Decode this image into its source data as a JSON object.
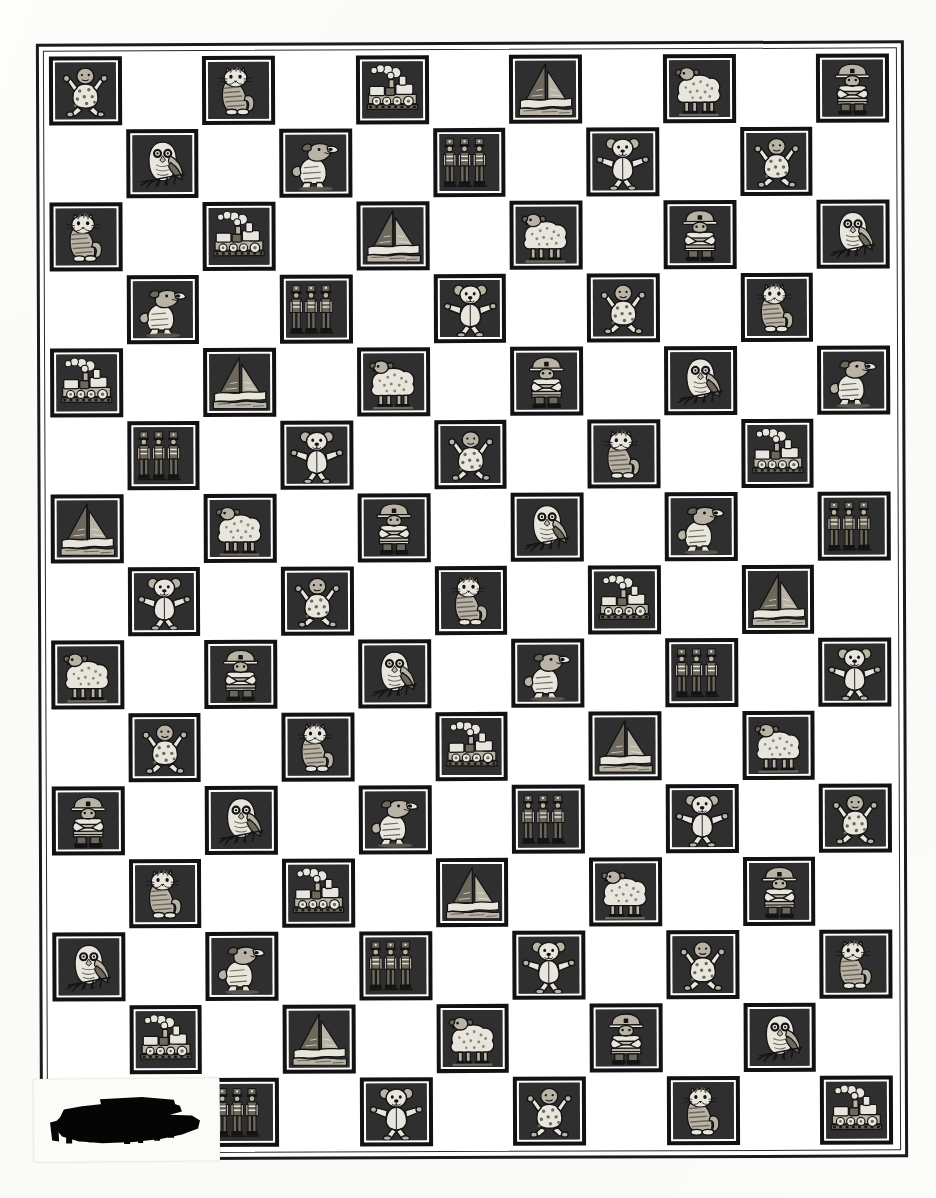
{
  "document": {
    "kind": "scanned-page",
    "description": "Checkerboard quilt / fabric design page of repeating nursery toy motifs in black bordered square blocks",
    "page_background": "#fdfdfb",
    "frame_color": "#1b1b1b",
    "tile_border_color": "#121212",
    "tile_mat_color": "#ffffff",
    "tile_field_color": "#2f2f2f"
  },
  "grid": {
    "columns": 11,
    "rows": 15,
    "pattern": "checkerboard — odd rows fill odd columns, even rows fill even columns",
    "motif_cycle": [
      "baby",
      "owl",
      "cat",
      "dog",
      "train",
      "soldiers",
      "sailboat",
      "teddy-bear",
      "sheep",
      "fireman"
    ],
    "motif_labels": {
      "baby": "Baby in polka-dot romper",
      "owl": "Owl on a branch",
      "cat": "Striped sitting cat",
      "dog": "Jumping dog",
      "train": "Steam locomotive",
      "soldiers": "Three toy soldiers",
      "sailboat": "Sailboat",
      "teddy-bear": "Teddy bear",
      "sheep": "Sheep",
      "fireman": "Fireman figure"
    },
    "rows_data": [
      {
        "row": 1,
        "parity": "odd",
        "cells": [
          {
            "col": 1,
            "motif": "baby"
          },
          {
            "col": 3,
            "motif": "cat"
          },
          {
            "col": 5,
            "motif": "train"
          },
          {
            "col": 7,
            "motif": "sailboat"
          },
          {
            "col": 9,
            "motif": "sheep"
          },
          {
            "col": 11,
            "motif": "fireman"
          }
        ]
      },
      {
        "row": 2,
        "parity": "even",
        "cells": [
          {
            "col": 2,
            "motif": "owl"
          },
          {
            "col": 4,
            "motif": "dog"
          },
          {
            "col": 6,
            "motif": "soldiers"
          },
          {
            "col": 8,
            "motif": "teddy-bear"
          },
          {
            "col": 10,
            "motif": "baby"
          }
        ]
      },
      {
        "row": 3,
        "parity": "odd",
        "cells": [
          {
            "col": 1,
            "motif": "cat"
          },
          {
            "col": 3,
            "motif": "train"
          },
          {
            "col": 5,
            "motif": "sailboat"
          },
          {
            "col": 7,
            "motif": "sheep"
          },
          {
            "col": 9,
            "motif": "fireman"
          },
          {
            "col": 11,
            "motif": "owl"
          }
        ]
      },
      {
        "row": 4,
        "parity": "even",
        "cells": [
          {
            "col": 2,
            "motif": "dog"
          },
          {
            "col": 4,
            "motif": "soldiers"
          },
          {
            "col": 6,
            "motif": "teddy-bear"
          },
          {
            "col": 8,
            "motif": "baby"
          },
          {
            "col": 10,
            "motif": "cat"
          }
        ]
      },
      {
        "row": 5,
        "parity": "odd",
        "cells": [
          {
            "col": 1,
            "motif": "train"
          },
          {
            "col": 3,
            "motif": "sailboat"
          },
          {
            "col": 5,
            "motif": "sheep"
          },
          {
            "col": 7,
            "motif": "fireman"
          },
          {
            "col": 9,
            "motif": "owl"
          },
          {
            "col": 11,
            "motif": "dog"
          }
        ]
      },
      {
        "row": 6,
        "parity": "even",
        "cells": [
          {
            "col": 2,
            "motif": "soldiers"
          },
          {
            "col": 4,
            "motif": "teddy-bear"
          },
          {
            "col": 6,
            "motif": "baby"
          },
          {
            "col": 8,
            "motif": "cat"
          },
          {
            "col": 10,
            "motif": "train"
          }
        ]
      },
      {
        "row": 7,
        "parity": "odd",
        "cells": [
          {
            "col": 1,
            "motif": "sailboat"
          },
          {
            "col": 3,
            "motif": "sheep"
          },
          {
            "col": 5,
            "motif": "fireman"
          },
          {
            "col": 7,
            "motif": "owl"
          },
          {
            "col": 9,
            "motif": "dog"
          },
          {
            "col": 11,
            "motif": "soldiers"
          }
        ]
      },
      {
        "row": 8,
        "parity": "even",
        "cells": [
          {
            "col": 2,
            "motif": "teddy-bear"
          },
          {
            "col": 4,
            "motif": "baby"
          },
          {
            "col": 6,
            "motif": "cat"
          },
          {
            "col": 8,
            "motif": "train"
          },
          {
            "col": 10,
            "motif": "sailboat"
          }
        ]
      },
      {
        "row": 9,
        "parity": "odd",
        "cells": [
          {
            "col": 1,
            "motif": "sheep"
          },
          {
            "col": 3,
            "motif": "fireman"
          },
          {
            "col": 5,
            "motif": "owl"
          },
          {
            "col": 7,
            "motif": "dog"
          },
          {
            "col": 9,
            "motif": "soldiers"
          },
          {
            "col": 11,
            "motif": "teddy-bear"
          }
        ]
      },
      {
        "row": 10,
        "parity": "even",
        "cells": [
          {
            "col": 2,
            "motif": "baby"
          },
          {
            "col": 4,
            "motif": "cat"
          },
          {
            "col": 6,
            "motif": "train"
          },
          {
            "col": 8,
            "motif": "sailboat"
          },
          {
            "col": 10,
            "motif": "sheep"
          }
        ]
      },
      {
        "row": 11,
        "parity": "odd",
        "cells": [
          {
            "col": 1,
            "motif": "fireman"
          },
          {
            "col": 3,
            "motif": "owl"
          },
          {
            "col": 5,
            "motif": "dog"
          },
          {
            "col": 7,
            "motif": "soldiers"
          },
          {
            "col": 9,
            "motif": "teddy-bear"
          },
          {
            "col": 11,
            "motif": "baby"
          }
        ]
      },
      {
        "row": 12,
        "parity": "even",
        "cells": [
          {
            "col": 2,
            "motif": "cat"
          },
          {
            "col": 4,
            "motif": "train"
          },
          {
            "col": 6,
            "motif": "sailboat"
          },
          {
            "col": 8,
            "motif": "sheep"
          },
          {
            "col": 10,
            "motif": "fireman"
          }
        ]
      },
      {
        "row": 13,
        "parity": "odd",
        "cells": [
          {
            "col": 1,
            "motif": "owl"
          },
          {
            "col": 3,
            "motif": "dog"
          },
          {
            "col": 5,
            "motif": "soldiers"
          },
          {
            "col": 7,
            "motif": "teddy-bear"
          },
          {
            "col": 9,
            "motif": "baby"
          },
          {
            "col": 11,
            "motif": "cat"
          }
        ]
      },
      {
        "row": 14,
        "parity": "even",
        "cells": [
          {
            "col": 2,
            "motif": "train"
          },
          {
            "col": 4,
            "motif": "sailboat"
          },
          {
            "col": 6,
            "motif": "sheep"
          },
          {
            "col": 8,
            "motif": "fireman"
          },
          {
            "col": 10,
            "motif": "owl"
          }
        ]
      },
      {
        "row": 15,
        "parity": "odd",
        "cells": [
          {
            "col": 3,
            "motif": "soldiers"
          },
          {
            "col": 5,
            "motif": "teddy-bear"
          },
          {
            "col": 7,
            "motif": "baby"
          },
          {
            "col": 9,
            "motif": "cat"
          },
          {
            "col": 11,
            "motif": "train"
          }
        ]
      }
    ]
  },
  "annotations": {
    "redacted_label": {
      "present": true,
      "position": "bottom-left",
      "text": "",
      "note": "Label obscured by heavy black marker redaction"
    }
  }
}
